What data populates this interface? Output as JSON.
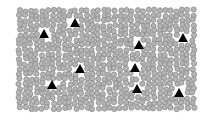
{
  "stimulus": {
    "type": "visual-search-display",
    "background": "#ffffff",
    "field": {
      "x": 17,
      "y": 8,
      "width": 181,
      "height": 103
    },
    "distractor": {
      "shape": "circle",
      "radius": 2.6,
      "fill": "#b4b4b4",
      "stroke": "#8c8c8c"
    },
    "target": {
      "shape": "triangle",
      "size": 9,
      "fill": "#000000"
    },
    "targets": [
      {
        "x": 75,
        "y": 23
      },
      {
        "x": 44,
        "y": 34
      },
      {
        "x": 183,
        "y": 38
      },
      {
        "x": 139,
        "y": 45
      },
      {
        "x": 80,
        "y": 69
      },
      {
        "x": 135,
        "y": 68
      },
      {
        "x": 52,
        "y": 85
      },
      {
        "x": 137,
        "y": 89
      },
      {
        "x": 179,
        "y": 93
      }
    ],
    "target_count": 9
  }
}
